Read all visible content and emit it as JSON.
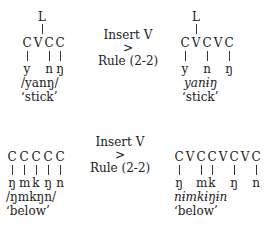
{
  "examples": [
    {
      "input": {
        "tone": "L",
        "skeleton": [
          "C",
          "V",
          "C",
          "C"
        ],
        "segments": [
          "y",
          "",
          "n",
          "ŋ"
        ],
        "phonemic": "/yanŋ/",
        "gloss": "‘stick’"
      },
      "rule": {
        "line1": "Insert V",
        "line2": ">",
        "line3": "Rule (2-2)"
      },
      "output": {
        "tone": "L",
        "skeleton": [
          "C",
          "V",
          "C",
          "V",
          "C"
        ],
        "segments": [
          "y",
          "",
          "n",
          "",
          "ŋ"
        ],
        "orthographic": "yanɨŋ",
        "gloss": "‘stick’"
      }
    },
    {
      "input": {
        "skeleton": [
          "C",
          "C",
          "C",
          "C",
          "C"
        ],
        "segments": [
          "ŋ",
          "m",
          "k",
          "ŋ",
          "n"
        ],
        "phonemic": "/ŋmkŋn/",
        "gloss": "‘below’"
      },
      "rule": {
        "line1": "Insert V",
        "line2": ">",
        "line3": "Rule (2-2)"
      },
      "output": {
        "skeleton": [
          "C",
          "V",
          "C",
          "C",
          "V",
          "C",
          "V",
          "C"
        ],
        "segments": [
          "ŋ",
          "",
          "m",
          "k",
          "",
          "ŋ",
          "",
          "n"
        ],
        "orthographic": "nɨmkɨŋɨn",
        "gloss": "‘below’"
      }
    }
  ]
}
